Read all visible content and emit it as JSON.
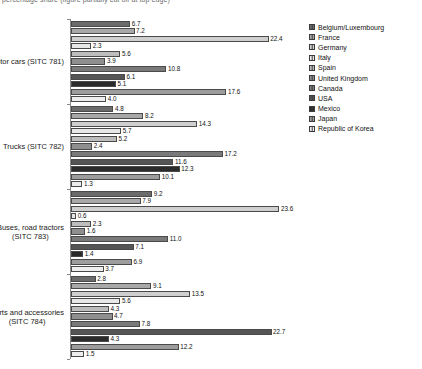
{
  "top_caption": "percentage share (figure partially cut off at top edge)",
  "legend": {
    "position": "right",
    "items": [
      {
        "label": "Belgium/Luxembourg",
        "color": "#6b6b6b"
      },
      {
        "label": "France",
        "color": "#a8a8a8"
      },
      {
        "label": "Germany",
        "color": "#cfcfcf"
      },
      {
        "label": "Italy",
        "color": "#e8e8e8"
      },
      {
        "label": "Spain",
        "color": "#bdbdbd"
      },
      {
        "label": "United Kingdom",
        "color": "#8f8f8f"
      },
      {
        "label": "Canada",
        "color": "#7a7a7a"
      },
      {
        "label": "USA",
        "color": "#555555"
      },
      {
        "label": "Mexico",
        "color": "#2b2b2b"
      },
      {
        "label": "Japan",
        "color": "#9d9d9d"
      },
      {
        "label": "Republic of Korea",
        "color": "#ededed"
      }
    ]
  },
  "chart_data": {
    "type": "bar",
    "orientation": "horizontal",
    "title": "",
    "xlabel": "",
    "ylabel": "",
    "xlim": [
      0,
      24
    ],
    "grid": false,
    "legend_position": "right",
    "categories": [
      "Motor cars (SITC 781)",
      "Trucks (SITC 782)",
      "Buses, road tractors (SITC 783)",
      "Parts and accessories (SITC 784)"
    ],
    "series": [
      {
        "name": "Belgium/Luxembourg",
        "color": "#6b6b6b",
        "values": [
          6.7,
          4.8,
          9.2,
          2.8
        ]
      },
      {
        "name": "France",
        "color": "#a8a8a8",
        "values": [
          7.2,
          8.2,
          7.9,
          9.1
        ]
      },
      {
        "name": "Germany",
        "color": "#cfcfcf",
        "values": [
          22.4,
          14.3,
          23.6,
          13.5
        ]
      },
      {
        "name": "Italy",
        "color": "#e8e8e8",
        "values": [
          2.3,
          5.7,
          0.6,
          5.6
        ]
      },
      {
        "name": "Spain",
        "color": "#bdbdbd",
        "values": [
          5.6,
          5.2,
          2.3,
          4.3
        ]
      },
      {
        "name": "United Kingdom",
        "color": "#8f8f8f",
        "values": [
          3.9,
          2.4,
          1.6,
          4.7
        ]
      },
      {
        "name": "Canada",
        "color": "#7a7a7a",
        "values": [
          10.8,
          17.2,
          11.0,
          7.8
        ]
      },
      {
        "name": "USA",
        "color": "#555555",
        "values": [
          6.1,
          11.6,
          7.1,
          22.7
        ]
      },
      {
        "name": "Mexico",
        "color": "#2b2b2b",
        "values": [
          5.1,
          12.3,
          1.4,
          4.3
        ]
      },
      {
        "name": "Japan",
        "color": "#9d9d9d",
        "values": [
          17.6,
          10.1,
          6.9,
          12.2
        ]
      },
      {
        "name": "Republic of Korea",
        "color": "#ededed",
        "values": [
          4.0,
          1.3,
          3.7,
          1.5
        ]
      }
    ],
    "groups": [
      {
        "label": "Motor cars (SITC 781)",
        "label_lines": [
          "Motor cars (SITC 781)"
        ],
        "bars": [
          {
            "name": "Belgium/Luxembourg",
            "value": 6.7,
            "color": "#6b6b6b"
          },
          {
            "name": "France",
            "value": 7.2,
            "color": "#a8a8a8"
          },
          {
            "name": "Germany",
            "value": 22.4,
            "color": "#cfcfcf"
          },
          {
            "name": "Italy",
            "value": 2.3,
            "color": "#e8e8e8"
          },
          {
            "name": "Spain",
            "value": 5.6,
            "color": "#bdbdbd"
          },
          {
            "name": "United Kingdom",
            "value": 3.9,
            "color": "#8f8f8f"
          },
          {
            "name": "Canada",
            "value": 10.8,
            "color": "#7a7a7a"
          },
          {
            "name": "USA",
            "value": 6.1,
            "color": "#555555"
          },
          {
            "name": "Mexico",
            "value": 5.1,
            "color": "#2b2b2b"
          },
          {
            "name": "Japan",
            "value": 17.6,
            "color": "#9d9d9d"
          },
          {
            "name": "Republic of Korea",
            "value": 4.0,
            "color": "#ededed"
          }
        ]
      },
      {
        "label": "Trucks (SITC 782)",
        "label_lines": [
          "Trucks (SITC 782)"
        ],
        "bars": [
          {
            "name": "Belgium/Luxembourg",
            "value": 4.8,
            "color": "#6b6b6b"
          },
          {
            "name": "France",
            "value": 8.2,
            "color": "#a8a8a8"
          },
          {
            "name": "Germany",
            "value": 14.3,
            "color": "#cfcfcf"
          },
          {
            "name": "Italy",
            "value": 5.7,
            "color": "#e8e8e8"
          },
          {
            "name": "Spain",
            "value": 5.2,
            "color": "#bdbdbd"
          },
          {
            "name": "United Kingdom",
            "value": 2.4,
            "color": "#8f8f8f"
          },
          {
            "name": "Canada",
            "value": 17.2,
            "color": "#7a7a7a"
          },
          {
            "name": "USA",
            "value": 11.6,
            "color": "#555555"
          },
          {
            "name": "Mexico",
            "value": 12.3,
            "color": "#2b2b2b"
          },
          {
            "name": "Japan",
            "value": 10.1,
            "color": "#9d9d9d"
          },
          {
            "name": "Republic of Korea",
            "value": 1.3,
            "color": "#ededed"
          }
        ]
      },
      {
        "label": "Buses, road tractors (SITC 783)",
        "label_lines": [
          "Buses, road tractors",
          "(SITC 783)"
        ],
        "bars": [
          {
            "name": "Belgium/Luxembourg",
            "value": 9.2,
            "color": "#6b6b6b"
          },
          {
            "name": "France",
            "value": 7.9,
            "color": "#a8a8a8"
          },
          {
            "name": "Germany",
            "value": 23.6,
            "color": "#cfcfcf"
          },
          {
            "name": "Italy",
            "value": 0.6,
            "color": "#e8e8e8"
          },
          {
            "name": "Spain",
            "value": 2.3,
            "color": "#bdbdbd"
          },
          {
            "name": "United Kingdom",
            "value": 1.6,
            "color": "#8f8f8f"
          },
          {
            "name": "Canada",
            "value": 11.0,
            "color": "#7a7a7a"
          },
          {
            "name": "USA",
            "value": 7.1,
            "color": "#555555"
          },
          {
            "name": "Mexico",
            "value": 1.4,
            "color": "#2b2b2b"
          },
          {
            "name": "Japan",
            "value": 6.9,
            "color": "#9d9d9d"
          },
          {
            "name": "Republic of Korea",
            "value": 3.7,
            "color": "#ededed"
          }
        ]
      },
      {
        "label": "Parts and accessories (SITC 784)",
        "label_lines": [
          "Parts and accessories",
          "(SITC 784)"
        ],
        "bars": [
          {
            "name": "Belgium/Luxembourg",
            "value": 2.8,
            "color": "#6b6b6b"
          },
          {
            "name": "France",
            "value": 9.1,
            "color": "#a8a8a8"
          },
          {
            "name": "Germany",
            "value": 13.5,
            "color": "#cfcfcf"
          },
          {
            "name": "Italy",
            "value": 5.6,
            "color": "#e8e8e8"
          },
          {
            "name": "Spain",
            "value": 4.3,
            "color": "#bdbdbd"
          },
          {
            "name": "United Kingdom",
            "value": 4.7,
            "color": "#8f8f8f"
          },
          {
            "name": "Canada",
            "value": 7.8,
            "color": "#7a7a7a"
          },
          {
            "name": "USA",
            "value": 22.7,
            "color": "#555555"
          },
          {
            "name": "Mexico",
            "value": 4.3,
            "color": "#2b2b2b"
          },
          {
            "name": "Japan",
            "value": 12.2,
            "color": "#9d9d9d"
          },
          {
            "name": "Republic of Korea",
            "value": 1.5,
            "color": "#ededed"
          }
        ]
      }
    ]
  }
}
